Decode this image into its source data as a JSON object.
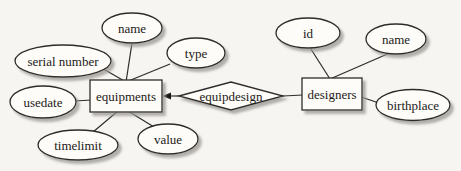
{
  "colors": {
    "background": "#f6f5f2",
    "shape_fill": "#fdfcf9",
    "outline": "#2e2c29",
    "shadow": "#9b9892",
    "text": "#1c1a17"
  },
  "er": {
    "entities": [
      {
        "label": "equipments"
      },
      {
        "label": "designers"
      }
    ],
    "relationships": [
      {
        "label": "equipdesign",
        "connects": [
          "equipments",
          "designers"
        ],
        "arrow_to": "equipments"
      }
    ],
    "attributes": {
      "equipments": [
        "name",
        "type",
        "serial number",
        "usedate",
        "timelimit",
        "value"
      ],
      "designers": [
        "id",
        "name",
        "birthplace"
      ]
    }
  }
}
